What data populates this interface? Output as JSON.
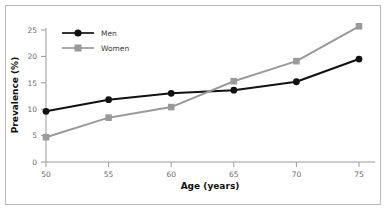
{
  "chart_data": {
    "type": "line",
    "title": "",
    "xlabel": "Age (years)",
    "ylabel": "Prevalence (%)",
    "x": [
      50,
      55,
      60,
      65,
      70,
      75
    ],
    "xticklabels": [
      "50",
      "55",
      "60",
      "65",
      "70",
      "75"
    ],
    "yticklabels": [
      "0",
      "5",
      "10",
      "15",
      "20",
      "25"
    ],
    "yticks": [
      0,
      5,
      10,
      15,
      20,
      25
    ],
    "xlim": [
      50,
      75
    ],
    "ylim": [
      0,
      25
    ],
    "grid": false,
    "legend_position": "top-left",
    "series": [
      {
        "name": "Men",
        "values": [
          9.6,
          11.8,
          13.0,
          13.6,
          15.2,
          19.5
        ],
        "color": "#111111",
        "marker": "circle"
      },
      {
        "name": "Women",
        "values": [
          4.7,
          8.4,
          10.4,
          15.3,
          19.1,
          25.7
        ],
        "color": "#9a9a9a",
        "marker": "square"
      }
    ]
  },
  "axes": {
    "axis_color": "#9a9a9a",
    "frame_color": "#b9b9b9"
  },
  "legend": {
    "men_label": "Men",
    "women_label": "Women"
  }
}
